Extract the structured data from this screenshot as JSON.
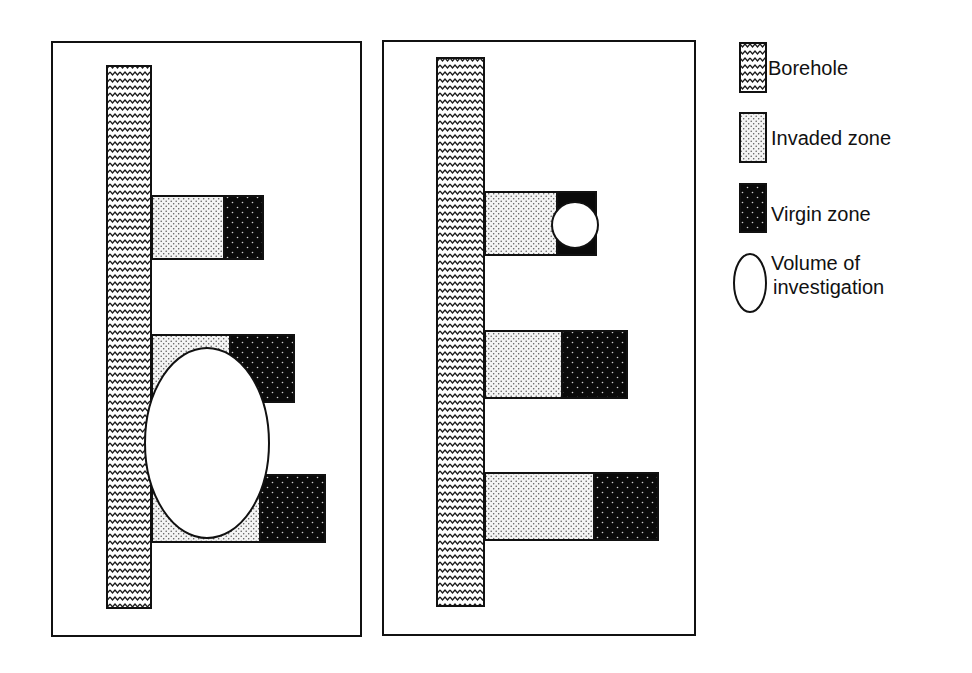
{
  "figure": {
    "panels": [
      {
        "id": "left",
        "description": "Large volume of investigation overlapping invaded and virgin zones",
        "bars": [
          {
            "invaded_width": 71,
            "virgin_width": 39
          },
          {
            "invaded_width": 77,
            "virgin_width": 64
          },
          {
            "invaded_width": 107,
            "virgin_width": 65
          }
        ],
        "volume_of_investigation": {
          "shape": "ellipse",
          "size": "large"
        }
      },
      {
        "id": "right",
        "description": "Small volume of investigation located in virgin zone",
        "bars": [
          {
            "invaded_width": 71,
            "virgin_width": 39
          },
          {
            "invaded_width": 76,
            "virgin_width": 65
          },
          {
            "invaded_width": 108,
            "virgin_width": 64
          }
        ],
        "volume_of_investigation": {
          "shape": "circle",
          "size": "small"
        }
      }
    ]
  },
  "legend": {
    "items": [
      {
        "key": "borehole",
        "label": "Borehole",
        "pattern": "wavy-hatch"
      },
      {
        "key": "invaded",
        "label": "Invaded zone",
        "pattern": "light-dots"
      },
      {
        "key": "virgin",
        "label": "Virgin zone",
        "pattern": "dark-dots"
      },
      {
        "key": "volume",
        "label_line1": "Volume of",
        "label_line2": "investigation",
        "pattern": "ellipse-outline"
      }
    ]
  },
  "colors": {
    "outline": "#111111",
    "background": "#ffffff",
    "invaded_fill": "#f2f2f2",
    "virgin_fill": "#0a0a0a"
  }
}
